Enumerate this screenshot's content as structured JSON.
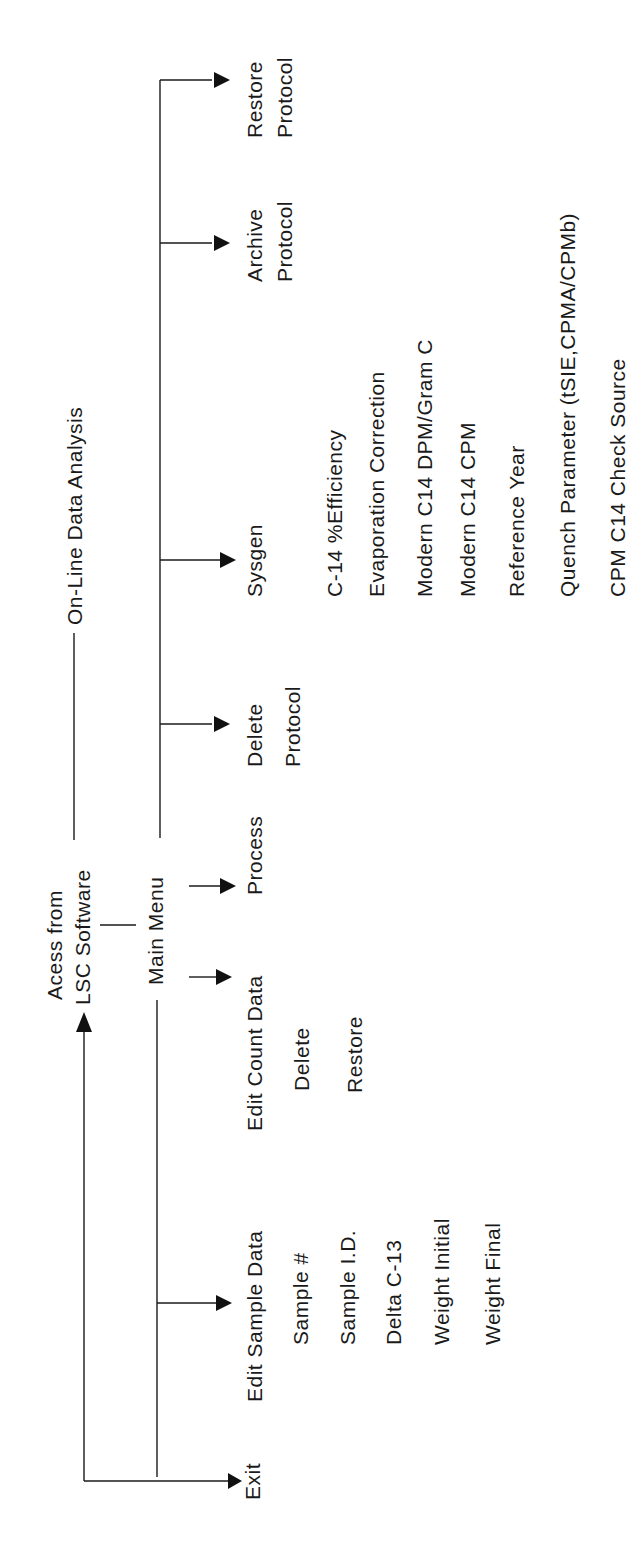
{
  "diagram": {
    "title": "On-Line Data Analysis",
    "entry": {
      "line1": "Acess from",
      "line2": "LSC Software"
    },
    "main_menu": "Main Menu",
    "menu_items": [
      {
        "id": "exit",
        "label": "Exit",
        "sub": []
      },
      {
        "id": "edit-sample-data",
        "label": "Edit Sample Data",
        "sub": [
          "Sample #",
          "Sample I.D.",
          "Delta C-13",
          "Weight Initial",
          "Weight Final"
        ]
      },
      {
        "id": "edit-count-data",
        "label": "Edit Count Data",
        "sub": [
          "Delete",
          "Restore"
        ]
      },
      {
        "id": "process",
        "label": "Process",
        "sub": []
      },
      {
        "id": "delete-protocol",
        "label": [
          "Delete",
          "Protocol"
        ],
        "sub": []
      },
      {
        "id": "sysgen",
        "label": "Sysgen",
        "sub": [
          "C-14 %Efficiency",
          "Evaporation Correction",
          "Modern C14 DPM/Gram C",
          "Modern C14 CPM",
          "Reference Year",
          "Quench Parameter (tSIE,CPMA/CPMb)",
          "CPM C14 Check Source"
        ]
      },
      {
        "id": "archive-protocol",
        "label": [
          "Archive",
          "Protocol"
        ],
        "sub": []
      },
      {
        "id": "restore-protocol",
        "label": [
          "Restore",
          "Protocol"
        ],
        "sub": []
      }
    ]
  }
}
